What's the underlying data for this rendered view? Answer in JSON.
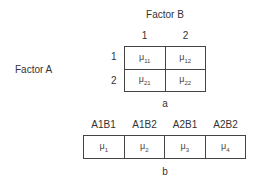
{
  "diagram_a": {
    "column_factor_label": "Factor B",
    "row_factor_label": "Factor A",
    "column_levels": [
      "1",
      "2"
    ],
    "row_levels": [
      "1",
      "2"
    ],
    "cells": [
      [
        {
          "symbol": "μ",
          "sub": "11"
        },
        {
          "symbol": "μ",
          "sub": "12"
        }
      ],
      [
        {
          "symbol": "μ",
          "sub": "21"
        },
        {
          "symbol": "μ",
          "sub": "22"
        }
      ]
    ],
    "caption": "a"
  },
  "diagram_b": {
    "headers": [
      "A1B1",
      "A1B2",
      "A2B1",
      "A2B2"
    ],
    "cells": [
      {
        "symbol": "μ",
        "sub": "1"
      },
      {
        "symbol": "μ",
        "sub": "2"
      },
      {
        "symbol": "μ",
        "sub": "3"
      },
      {
        "symbol": "μ",
        "sub": "4"
      }
    ],
    "caption": "b"
  }
}
